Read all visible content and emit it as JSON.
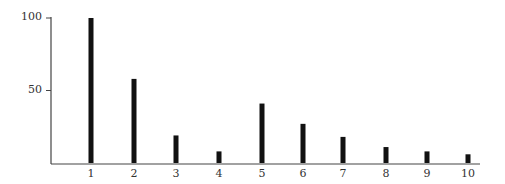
{
  "chart_data": {
    "type": "bar",
    "title": "",
    "xlabel": "",
    "ylabel": "",
    "categories": [
      "1",
      "2",
      "3",
      "4",
      "5",
      "6",
      "7",
      "8",
      "9",
      "10"
    ],
    "values": [
      100,
      58,
      19,
      8,
      41,
      27,
      18,
      11,
      8,
      6
    ],
    "ylim": [
      0,
      100
    ],
    "yticks": [
      50,
      100
    ],
    "ytick_labels": [
      "50",
      "100"
    ],
    "grid": false,
    "legend": null,
    "bar_color": "#111111",
    "axis_color": "#444444"
  }
}
